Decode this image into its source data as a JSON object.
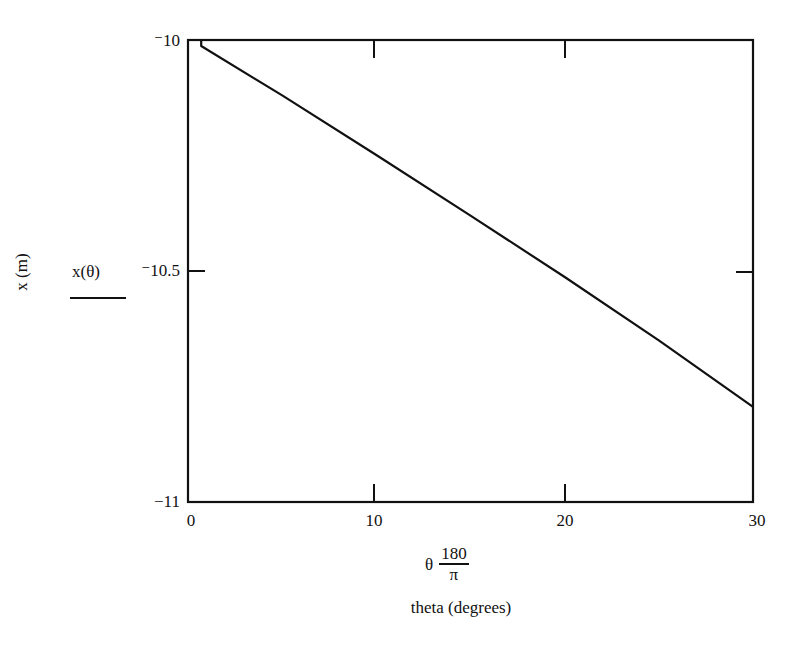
{
  "chart_data": {
    "type": "line",
    "title": "",
    "xlabel": "theta (degrees)",
    "x_expression": {
      "prefix": "θ",
      "numerator": "180",
      "denominator": "π"
    },
    "ylabel": "x (m)",
    "y_expression": "x(θ)",
    "xlim": [
      0,
      30
    ],
    "ylim": [
      -11,
      -10
    ],
    "x_ticks": [
      "0",
      "10",
      "20",
      "30"
    ],
    "y_ticks": [
      "⁻10",
      "⁻10.5",
      "⁻11"
    ],
    "grid": false,
    "legend": null,
    "series": [
      {
        "name": "x(θ)",
        "color": "#111111",
        "x": [
          0.7,
          5,
          10,
          15,
          20,
          25,
          30
        ],
        "y": [
          -10.013,
          -10.12,
          -10.249,
          -10.38,
          -10.513,
          -10.65,
          -10.794
        ]
      }
    ]
  },
  "labels": {
    "y_tick_top": "⁻10",
    "y_tick_mid": "⁻10.5",
    "y_tick_bottom": "−11",
    "x_tick_0": "0",
    "x_tick_10": "10",
    "x_tick_20": "20",
    "x_tick_30": "30",
    "y_axis_title": "x (m)",
    "y_expr": "x(θ)",
    "x_expr_prefix": "θ",
    "x_expr_num": "180",
    "x_expr_den": "π",
    "x_axis_title": "theta (degrees)"
  }
}
